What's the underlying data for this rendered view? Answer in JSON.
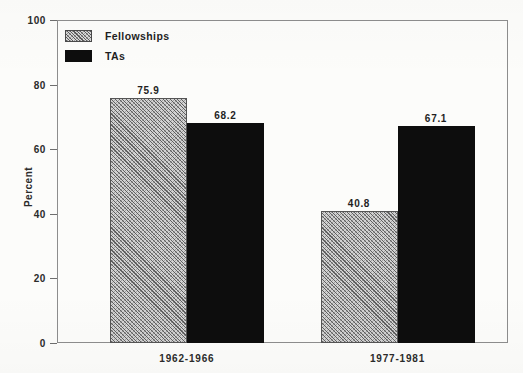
{
  "chart_data": {
    "type": "bar",
    "title": "",
    "subtitle": "",
    "xlabel": "",
    "ylabel": "Percent",
    "ylim": [
      0,
      100
    ],
    "yticks": [
      0,
      20,
      40,
      60,
      80,
      100
    ],
    "ytick_labels": [
      "0",
      "20",
      "40",
      "60",
      "80",
      "100"
    ],
    "grid": false,
    "legend_position": "top-left-inside",
    "categories": [
      "1962-1966",
      "1977-1981"
    ],
    "series": [
      {
        "name": "Fellowships",
        "fill": "diagonal-crosshatch",
        "color": "#d2d2d2",
        "values": [
          75.9,
          40.8
        ],
        "value_labels": [
          "75.9",
          "40.8"
        ]
      },
      {
        "name": "TAs",
        "fill": "solid",
        "color": "#0d0d0d",
        "values": [
          68.2,
          67.1
        ],
        "value_labels": [
          "68.2",
          "67.1"
        ]
      }
    ],
    "annotations": []
  },
  "legend": {
    "items": [
      {
        "label": "Fellowships",
        "swatch": "hatch"
      },
      {
        "label": "TAs",
        "swatch": "solid"
      }
    ]
  },
  "axes": {
    "y_axis_title": "Percent",
    "frame_color": "#8d8d8d"
  }
}
